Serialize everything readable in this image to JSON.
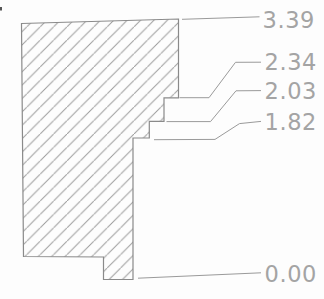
{
  "drawing": {
    "kind": "dimensioned-cross-section-profile",
    "background_color": "#fdfdfd",
    "outline_color": "#8a8a8a",
    "hatch_color": "#9c9c9c",
    "leader_color": "#9a9a9a",
    "label_color": "#a4a4a4",
    "artifact_color": "#555555",
    "dimensions": [
      {
        "value": "3.39"
      },
      {
        "value": "2.34"
      },
      {
        "value": "2.03"
      },
      {
        "value": "1.82"
      },
      {
        "value": "0.00"
      }
    ]
  }
}
